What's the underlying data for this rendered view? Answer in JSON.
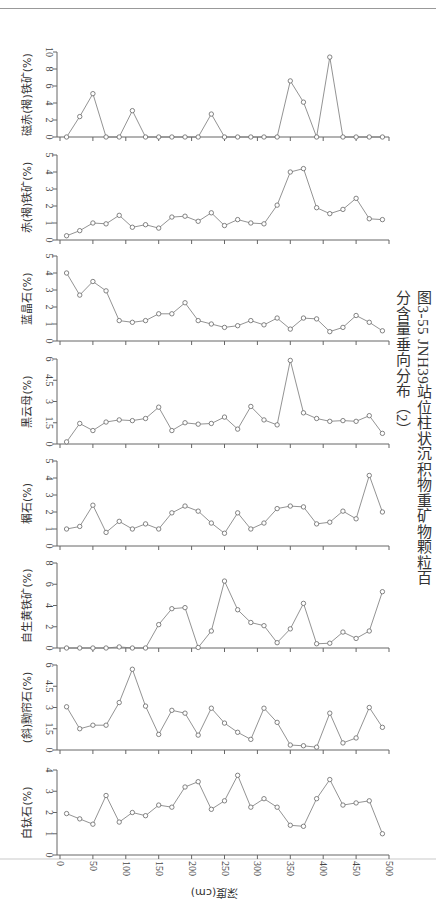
{
  "caption": "图3-55   JNH39站位柱状沉积物重矿物颗粒百分含量垂向分布（2）",
  "chart_data": {
    "type": "line",
    "title": "图3-55 JNH39站位柱状沉积物重矿物颗粒百分含量垂向分布（2）",
    "xlabel": "深度(cm)",
    "x_ticks": [
      0,
      50,
      100,
      150,
      200,
      250,
      300,
      350,
      400,
      450,
      500
    ],
    "x_tick_labels": [
      "0",
      "50",
      "100",
      "150",
      "200",
      "250",
      "300",
      "350",
      "400",
      "450",
      "500"
    ],
    "xlim": [
      0,
      500
    ],
    "x": [
      10,
      30,
      50,
      70,
      90,
      110,
      130,
      150,
      170,
      190,
      210,
      230,
      250,
      270,
      290,
      310,
      330,
      350,
      370,
      390,
      410,
      430,
      450,
      470,
      490
    ],
    "grid": false,
    "marker": "open-circle",
    "series": [
      {
        "name": "磁赤(褐)铁矿(%)",
        "ylim": [
          0,
          10
        ],
        "yticks": [
          0,
          2,
          4,
          6,
          8,
          10
        ],
        "values": [
          0,
          2.4,
          5.1,
          0,
          0,
          3.1,
          0,
          0,
          0,
          0,
          0,
          2.7,
          0,
          0,
          0,
          0,
          0,
          6.6,
          4.1,
          0,
          9.4,
          0,
          0,
          0,
          0
        ]
      },
      {
        "name": "赤(褐)铁矿(%)",
        "ylim": [
          0,
          5
        ],
        "yticks": [
          0,
          1,
          2,
          3,
          4,
          5
        ],
        "values": [
          0.25,
          0.55,
          1.0,
          0.95,
          1.45,
          0.75,
          0.9,
          0.7,
          1.35,
          1.4,
          1.1,
          1.6,
          0.85,
          1.2,
          1.0,
          0.95,
          2.05,
          4.0,
          4.2,
          1.9,
          1.55,
          1.8,
          2.45,
          1.25,
          1.2
        ]
      },
      {
        "name": "蓝晶石(%)",
        "ylim": [
          0,
          5
        ],
        "yticks": [
          0,
          1,
          2,
          3,
          4,
          5
        ],
        "values": [
          4.0,
          2.7,
          3.5,
          2.95,
          1.2,
          1.1,
          1.2,
          1.6,
          1.6,
          2.25,
          1.2,
          1.0,
          0.8,
          0.9,
          1.2,
          0.95,
          1.35,
          0.7,
          1.35,
          1.3,
          0.55,
          0.8,
          1.5,
          1.1,
          0.6
        ]
      },
      {
        "name": "黑云母(%)",
        "ylim": [
          0,
          6
        ],
        "yticks": [
          0,
          1.5,
          3,
          4.5,
          6
        ],
        "values": [
          0.15,
          1.45,
          0.95,
          1.55,
          1.7,
          1.65,
          1.8,
          2.6,
          0.95,
          1.5,
          1.4,
          1.45,
          1.9,
          1.05,
          2.65,
          1.7,
          1.35,
          5.9,
          2.2,
          1.8,
          1.6,
          1.65,
          1.6,
          2.0,
          0.75
        ]
      },
      {
        "name": "榍石(%)",
        "ylim": [
          0,
          5
        ],
        "yticks": [
          0,
          1,
          2,
          3,
          4,
          5
        ],
        "values": [
          1.0,
          1.15,
          2.4,
          0.8,
          1.45,
          1.0,
          1.3,
          1.0,
          1.95,
          2.35,
          2.05,
          1.35,
          0.75,
          1.95,
          1.0,
          1.35,
          2.2,
          2.35,
          2.3,
          1.3,
          1.4,
          2.05,
          1.6,
          4.15,
          2.0
        ]
      },
      {
        "name": "自生黄铁矿(%)",
        "ylim": [
          0,
          8
        ],
        "yticks": [
          0,
          2,
          4,
          6,
          8
        ],
        "values": [
          0,
          0,
          0,
          0,
          0.1,
          0,
          0,
          2.2,
          3.7,
          3.8,
          0.05,
          1.6,
          6.3,
          3.6,
          2.4,
          2.1,
          0.5,
          1.8,
          4.2,
          0.4,
          0.45,
          1.5,
          0.9,
          1.6,
          5.3
        ]
      },
      {
        "name": "(斜)黝帘石(%)",
        "ylim": [
          0,
          6
        ],
        "yticks": [
          0,
          1.5,
          3,
          4.5,
          6
        ],
        "values": [
          3.05,
          1.5,
          1.75,
          1.75,
          3.35,
          5.7,
          3.1,
          1.1,
          2.8,
          2.6,
          1.05,
          2.95,
          1.9,
          1.25,
          0.75,
          2.95,
          1.95,
          0.35,
          0.3,
          0.2,
          2.6,
          0.5,
          0.85,
          3.0,
          1.6
        ]
      },
      {
        "name": "白钛石(%)",
        "ylim": [
          0,
          4
        ],
        "yticks": [
          0,
          1,
          2,
          3,
          4
        ],
        "values": [
          1.95,
          1.7,
          1.45,
          2.8,
          1.55,
          2.0,
          1.85,
          2.35,
          2.25,
          3.2,
          3.45,
          2.15,
          2.55,
          3.75,
          2.25,
          2.65,
          2.25,
          1.4,
          1.35,
          2.65,
          3.55,
          2.35,
          2.45,
          2.55,
          1.0
        ]
      }
    ]
  },
  "panels_layout": [
    {
      "top": 52,
      "bottom": 137
    },
    {
      "top": 155,
      "bottom": 240
    },
    {
      "top": 256,
      "bottom": 341
    },
    {
      "top": 359,
      "bottom": 444
    },
    {
      "top": 461,
      "bottom": 546
    },
    {
      "top": 563,
      "bottom": 648
    },
    {
      "top": 665,
      "bottom": 750
    },
    {
      "top": 770,
      "bottom": 855
    }
  ]
}
